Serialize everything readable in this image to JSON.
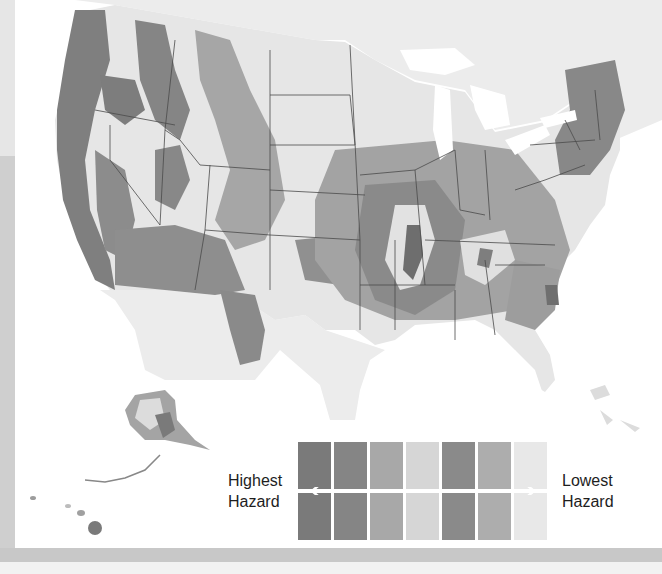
{
  "map": {
    "subject": "United States seismic hazard map",
    "regions_shown": [
      "Contiguous United States",
      "Alaska",
      "Hawaii",
      "Southern Canada",
      "Northern Mexico",
      "Bahamas"
    ],
    "colors": {
      "ocean": "#ffffff",
      "land_outside": "#ececec",
      "border": "#4a4a4a"
    }
  },
  "legend": {
    "high_label_line1": "Highest",
    "high_label_line2": "Hazard",
    "low_label_line1": "Lowest",
    "low_label_line2": "Hazard",
    "arrow_left_icon": "arrow-left-icon",
    "arrow_right_icon": "arrow-right-icon",
    "levels": [
      {
        "rank": 1,
        "color": "#7a7a7a"
      },
      {
        "rank": 2,
        "color": "#858585"
      },
      {
        "rank": 3,
        "color": "#a8a8a8"
      },
      {
        "rank": 4,
        "color": "#d6d6d6"
      },
      {
        "rank": 5,
        "color": "#8a8a8a"
      },
      {
        "rank": 6,
        "color": "#adadad"
      },
      {
        "rank": 7,
        "color": "#e8e8e8"
      }
    ]
  }
}
